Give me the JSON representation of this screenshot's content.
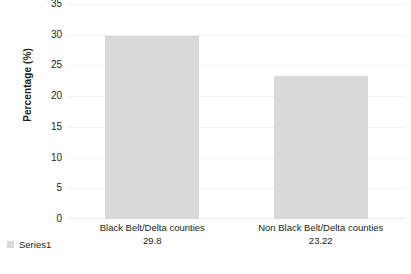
{
  "chart_data": {
    "type": "bar",
    "title": "",
    "subtitle": "",
    "xlabel": "",
    "ylabel": "Percentage (%)",
    "categories": [
      "Black Belt/Delta counties",
      "Non Black Belt/Delta counties"
    ],
    "values": [
      29.8,
      23.22
    ],
    "value_labels": [
      "29.8",
      "23.22"
    ],
    "series": [
      {
        "name": "Series1",
        "values": [
          29.8,
          23.22
        ],
        "color": "#d9d9d9"
      }
    ],
    "ylim": [
      0,
      35
    ],
    "ytick_labels": [
      "35",
      "30",
      "25",
      "20",
      "15",
      "10",
      "5",
      "0"
    ],
    "ytick_values": [
      35,
      30,
      25,
      20,
      15,
      10,
      5,
      0
    ],
    "grid": true,
    "grid_color": "#f2f2f2",
    "legend_position": "bottom-left",
    "background_color": "#ffffff",
    "text_color": "#231f20"
  },
  "legend": {
    "entries": [
      {
        "label": "Series1",
        "color": "#d9d9d9"
      }
    ]
  },
  "axes": {
    "y_title": "Percentage (%)",
    "top_clipped_label": "40"
  }
}
